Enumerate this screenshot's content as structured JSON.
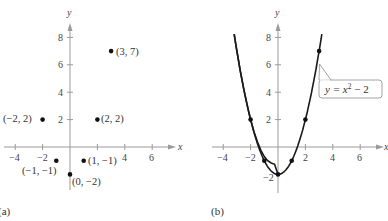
{
  "chart_data": [
    {
      "panel": "a",
      "type": "scatter",
      "label": "(a)",
      "xlabel": "x",
      "ylabel": "y",
      "x_ticks": [
        -4,
        -2,
        2,
        4,
        6
      ],
      "y_ticks": [
        2,
        4,
        6,
        8
      ],
      "xlim": [
        -5,
        8
      ],
      "ylim": [
        -3,
        9
      ],
      "grid": false,
      "points": [
        {
          "x": -2,
          "y": 2,
          "label": "(−2, 2)"
        },
        {
          "x": -1,
          "y": -1,
          "label": "(−1, −1)"
        },
        {
          "x": 0,
          "y": -2,
          "label": "(0, −2)"
        },
        {
          "x": 1,
          "y": -1,
          "label": "(1, −1)"
        },
        {
          "x": 2,
          "y": 2,
          "label": "(2, 2)"
        },
        {
          "x": 3,
          "y": 7,
          "label": "(3, 7)"
        }
      ]
    },
    {
      "panel": "b",
      "type": "line",
      "label": "(b)",
      "xlabel": "x",
      "ylabel": "y",
      "x_ticks": [
        -4,
        -2,
        2,
        4,
        6
      ],
      "y_ticks": [
        -2,
        2,
        4,
        6,
        8
      ],
      "xlim": [
        -5,
        8
      ],
      "ylim": [
        -3,
        9
      ],
      "grid": false,
      "annotation": "y = x² − 2",
      "series": [
        {
          "name": "y = x^2 - 2",
          "x": [
            -3.2,
            -3,
            -2,
            -1,
            0,
            1,
            2,
            3,
            3.2
          ],
          "y": [
            8.24,
            7,
            2,
            -1,
            -2,
            -1,
            2,
            7,
            8.24
          ]
        }
      ],
      "marked_points": [
        {
          "x": -2,
          "y": 2
        },
        {
          "x": -1,
          "y": -1
        },
        {
          "x": 0,
          "y": -2
        },
        {
          "x": 1,
          "y": -1
        },
        {
          "x": 2,
          "y": 2
        },
        {
          "x": 3,
          "y": 7
        }
      ]
    }
  ],
  "labels": {
    "panel_a": "(a)",
    "panel_b": "(b)",
    "x_axis": "x",
    "y_axis": "y",
    "equation_prefix": "y = x",
    "equation_exp": "2",
    "equation_suffix": " − 2",
    "pt_m2_2": "(−2, 2)",
    "pt_m1_m1": "(−1, −1)",
    "pt_0_m2": "(0, −2)",
    "pt_1_m1": "(1, −1)",
    "pt_2_2": "(2, 2)",
    "pt_3_7": "(3, 7)",
    "tick_m4": "−4",
    "tick_m2": "−2",
    "tick_2": "2",
    "tick_4": "4",
    "tick_6": "6",
    "tick_8": "8"
  }
}
